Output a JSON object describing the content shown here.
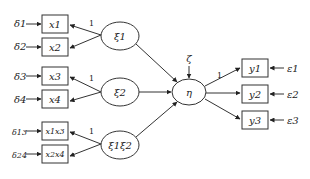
{
  "diagram": {
    "type": "structural-equation-model",
    "errors_x": [
      "δ1",
      "δ2",
      "δ3",
      "δ4",
      "δ13",
      "δ24"
    ],
    "indicators_x": [
      "x1",
      "x2",
      "x3",
      "x4",
      "x1x3",
      "x2x4"
    ],
    "latent_exogenous": [
      "ξ1",
      "ξ2",
      "ξ1ξ2"
    ],
    "latent_endogenous": "η",
    "disturbance": "ζ",
    "indicators_y": [
      "y1",
      "y2",
      "y3"
    ],
    "errors_y": [
      "ε1",
      "ε2",
      "ε3"
    ],
    "fixed_loading_label": "1"
  }
}
